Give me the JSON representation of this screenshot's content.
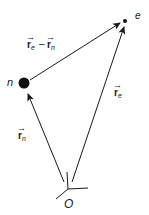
{
  "diagram": {
    "type": "position-vectors",
    "colors": {
      "line": "#1a1a1a",
      "text": "#1a1a1a",
      "background": "#ffffff"
    },
    "origin": {
      "label": "O"
    },
    "nodes": [
      {
        "id": "n",
        "label": "n",
        "kind": "large-dot"
      },
      {
        "id": "e",
        "label": "e",
        "kind": "small-dot"
      }
    ],
    "vectors": [
      {
        "id": "r_n",
        "from": "O",
        "to": "n",
        "symbol": "r",
        "subscript": "n",
        "arrow_glyph": "→"
      },
      {
        "id": "r_e",
        "from": "O",
        "to": "e",
        "symbol": "r",
        "subscript": "e",
        "arrow_glyph": "→"
      },
      {
        "id": "r_e_minus_r_n",
        "from": "n",
        "to": "e",
        "terms": [
          {
            "symbol": "r",
            "subscript": "e",
            "arrow_glyph": "→"
          },
          {
            "symbol": "r",
            "subscript": "n",
            "arrow_glyph": "→"
          }
        ],
        "operator": "–"
      }
    ]
  }
}
